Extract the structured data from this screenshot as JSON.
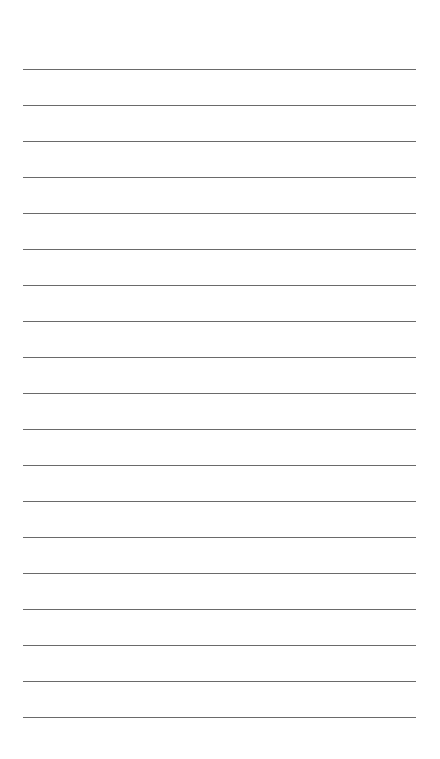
{
  "page": {
    "type": "lined-paper",
    "background": "#ffffff",
    "line_color": "#6a6a6a",
    "line_left": 23,
    "line_right": 416,
    "first_line_y": 69,
    "line_spacing": 36,
    "line_count": 19
  }
}
